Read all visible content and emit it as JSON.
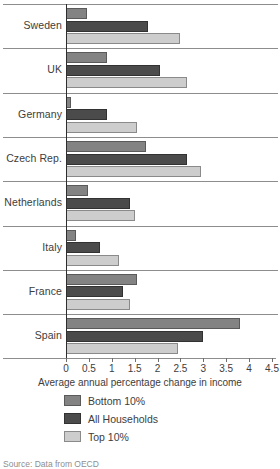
{
  "chart_data": {
    "type": "bar",
    "orientation": "horizontal",
    "title": "",
    "subtitle": "",
    "xlabel": "Average annual percentage change in income",
    "ylabel": "",
    "xlim": [
      0,
      4.5
    ],
    "xticks": [
      0,
      0.5,
      1,
      1.5,
      2,
      2.5,
      3,
      3.5,
      4,
      4.5
    ],
    "xtick_labels": [
      "0",
      "0.5",
      "1",
      "1.5",
      "2",
      "2.5",
      "3",
      "3.5",
      "4",
      "4.5"
    ],
    "grid": false,
    "legend_position": "bottom",
    "categories": [
      "Sweden",
      "UK",
      "Germany",
      "Czech Rep.",
      "Netherlands",
      "Italy",
      "France",
      "Spain"
    ],
    "series": [
      {
        "name": "Bottom 10%",
        "color": "#838383",
        "values": [
          0.45,
          0.9,
          0.1,
          1.75,
          0.48,
          0.22,
          1.55,
          3.8
        ]
      },
      {
        "name": "All Households",
        "color": "#4b4b4b",
        "values": [
          1.8,
          2.05,
          0.9,
          2.65,
          1.4,
          0.75,
          1.25,
          3.0
        ]
      },
      {
        "name": "Top 10%",
        "color": "#cdcdcd",
        "values": [
          2.5,
          2.65,
          1.55,
          2.95,
          1.5,
          1.15,
          1.4,
          2.45
        ]
      }
    ],
    "source": "Source: Data from OECD"
  }
}
